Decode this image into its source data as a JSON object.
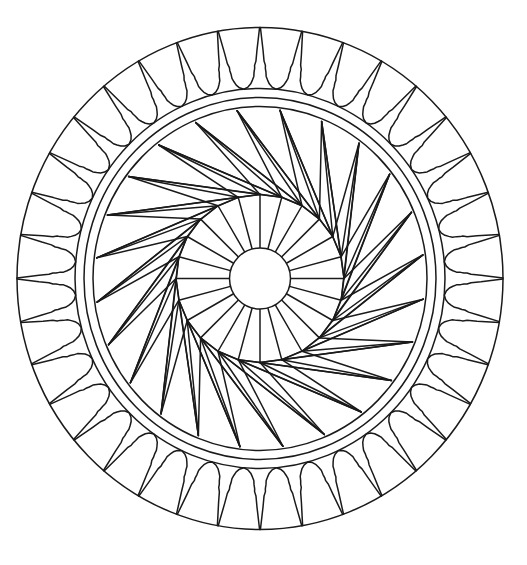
{
  "image": {
    "description": "Black-and-white mandala line drawing (coloring page) with outer ring of tulip-shaped petals, triple concentric bands, a pinwheel spiral of straight lines, a ring of radial spokes and a plain central circle",
    "background": "#ffffff",
    "stroke": "#1a1a1a",
    "stroke_width": 1.5
  },
  "geometry": {
    "center": [
      260,
      278.5
    ],
    "outer_circle": {
      "rx": 243,
      "ry": 251
    },
    "bands": [
      {
        "rx": 185,
        "ry": 190
      },
      {
        "rx": 176,
        "ry": 181
      },
      {
        "rx": 167,
        "ry": 172
      }
    ],
    "petals": {
      "count": 36,
      "start_angle_deg": -90,
      "bulb_radius_scale": 1.0
    },
    "spiral": {
      "vertex_count": 24,
      "vertex_radius": 84,
      "outer_radius_scale": 0.985,
      "fan_offsets_deg": [
        23,
        38,
        53,
        68
      ]
    },
    "spokes": {
      "count": 24,
      "start_angle_deg": -90
    },
    "inner_circle": {
      "r": 30.5
    }
  }
}
